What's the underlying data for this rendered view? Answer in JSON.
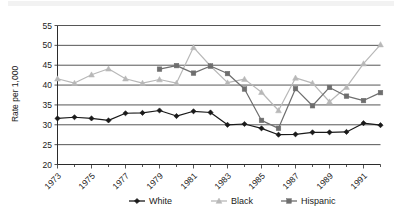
{
  "chart_data": {
    "type": "line",
    "title": "",
    "xlabel": "",
    "ylabel": "Rate per 1,000",
    "ylim": [
      20,
      55
    ],
    "ytick_values": [
      20,
      25,
      30,
      35,
      40,
      45,
      50,
      55
    ],
    "grid": true,
    "legend_position": "bottom",
    "x": [
      1973,
      1974,
      1975,
      1976,
      1977,
      1978,
      1979,
      1980,
      1981,
      1982,
      1983,
      1984,
      1985,
      1986,
      1987,
      1988,
      1989,
      1990,
      1991,
      1992
    ],
    "xtick_labels": [
      "1973",
      "1975",
      "1977",
      "1979",
      "1981",
      "1983",
      "1985",
      "1987",
      "1989",
      "1991"
    ],
    "xtick_years": [
      1973,
      1975,
      1977,
      1979,
      1981,
      1983,
      1985,
      1987,
      1989,
      1991
    ],
    "series": [
      {
        "name": "White",
        "color": "#1a1a1a",
        "marker": "diamond",
        "values": [
          31.6,
          31.9,
          31.6,
          31.1,
          32.9,
          33.0,
          33.6,
          32.2,
          33.4,
          33.1,
          30.0,
          30.2,
          29.1,
          27.5,
          27.6,
          28.1,
          28.1,
          28.2,
          30.4,
          29.9
        ]
      },
      {
        "name": "Black",
        "color": "#b8b8b8",
        "marker": "triangle",
        "values": [
          41.6,
          40.5,
          42.6,
          44.1,
          41.6,
          40.5,
          41.4,
          40.5,
          49.5,
          44.8,
          40.6,
          41.5,
          38.2,
          33.6,
          41.8,
          40.5,
          35.8,
          39.5,
          45.4,
          50.2
        ]
      },
      {
        "name": "Hispanic",
        "color": "#6e6e6e",
        "marker": "square",
        "values": [
          null,
          null,
          null,
          null,
          null,
          null,
          44.0,
          44.9,
          43.0,
          44.8,
          42.9,
          39.0,
          31.1,
          29.1,
          39.1,
          34.8,
          39.4,
          37.2,
          36.1,
          38.1
        ]
      }
    ]
  },
  "legend": {
    "items": [
      {
        "label": "White"
      },
      {
        "label": "Black"
      },
      {
        "label": "Hispanic"
      }
    ]
  }
}
